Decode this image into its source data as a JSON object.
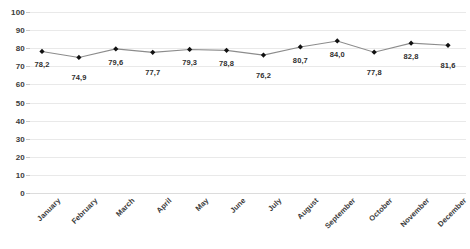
{
  "chart_data": {
    "type": "line",
    "title": "",
    "subtitle": "",
    "xlabel": "",
    "ylabel": "",
    "categories": [
      "January",
      "February",
      "March",
      "April",
      "May",
      "June",
      "July",
      "August",
      "September",
      "October",
      "November",
      "December"
    ],
    "values": [
      78.2,
      74.9,
      79.6,
      77.7,
      79.3,
      78.8,
      76.2,
      80.7,
      84.0,
      77.8,
      82.8,
      81.6
    ],
    "value_labels": [
      "78,2",
      "74,9",
      "79,6",
      "77,7",
      "79,3",
      "78,8",
      "76,2",
      "80,7",
      "84,0",
      "77,8",
      "82,8",
      "81,6"
    ],
    "ylim": [
      0,
      100
    ],
    "ytick_values": [
      100,
      90,
      80,
      70,
      60,
      50,
      40,
      30,
      20,
      10,
      0
    ],
    "ytick_labels": [
      "100",
      "90",
      "80",
      "70",
      "60",
      "50",
      "40",
      "30",
      "20",
      "10",
      "0"
    ],
    "grid": true,
    "legend": false,
    "legend_position": "none",
    "series": [
      {
        "name": "",
        "values": [
          78.2,
          74.9,
          79.6,
          77.7,
          79.3,
          78.8,
          76.2,
          80.7,
          84.0,
          77.8,
          82.8,
          81.6
        ],
        "line_color": "#8c8c8c",
        "marker_color": "#111111",
        "marker": "diamond"
      }
    ],
    "colors": {
      "background": "#ffffff",
      "gridline": "#e9e9e9",
      "baseline": "#dcdcdc",
      "line": "#8c8c8c",
      "marker": "#111111",
      "tick_text": "#3b3b3b",
      "label_text": "#2f2f2f"
    }
  }
}
